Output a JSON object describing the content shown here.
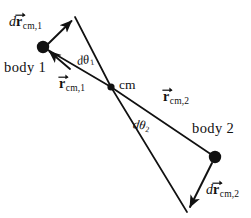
{
  "figure": {
    "kind": "physics-vector-diagram",
    "width": 251,
    "height": 218,
    "background_color": "#ffffff",
    "stroke_color": "#111111",
    "marker_color": "#111111"
  },
  "labels": {
    "dr1": {
      "d": "d",
      "vector": "r",
      "subscript": "cm,1",
      "full_text": "dr_cm,1"
    },
    "body1": "body 1",
    "dtheta1": {
      "d": "d",
      "symbol": "θ",
      "subscript": "1",
      "full_text": "dθ_1"
    },
    "rcm1": {
      "vector": "r",
      "subscript": "cm,1",
      "full_text": "r_cm,1"
    },
    "cm": "cm",
    "rcm2": {
      "vector": "r",
      "subscript": "cm,2",
      "full_text": "r_cm,2"
    },
    "dtheta2": {
      "d": "d",
      "symbol": "θ",
      "subscript": "2",
      "full_text": "dθ_2"
    },
    "body2": "body 2",
    "dr2": {
      "d": "d",
      "vector": "r",
      "subscript": "cm,2",
      "full_text": "dr_cm,2"
    }
  },
  "geometry": {
    "points": {
      "cm": {
        "x": 111,
        "y": 87,
        "name": "center-of-mass",
        "marker": "filled-dot",
        "radius": 3.6
      },
      "body1": {
        "x": 43,
        "y": 47,
        "name": "body-1-position",
        "marker": "filled-dot",
        "radius": 6.2
      },
      "body1_rotated": {
        "x": 75,
        "y": 17,
        "name": "body-1-rotated-position",
        "marker": "none"
      },
      "body2": {
        "x": 215,
        "y": 157,
        "name": "body-2-position",
        "marker": "filled-dot",
        "radius": 6.2
      },
      "body2_rotated": {
        "x": 187,
        "y": 212,
        "name": "body-2-rotated-position",
        "marker": "none"
      }
    },
    "segments": [
      {
        "name": "r-cm-1-line",
        "from": "cm",
        "to": "body1",
        "arrow": false
      },
      {
        "name": "r-cm-1-rotated-line",
        "from": "cm",
        "to": "body1_rotated",
        "arrow": false
      },
      {
        "name": "r-cm-2-line",
        "from": "cm",
        "to": "body2",
        "arrow": false
      },
      {
        "name": "r-cm-2-rotated-line",
        "from": "cm",
        "to": "body2_rotated",
        "arrow": false
      }
    ],
    "displacement_arrows": [
      {
        "name": "dr-cm-1-arrow",
        "from": "body1",
        "to": "body1_rotated",
        "label": "dr1"
      },
      {
        "name": "dr-cm-1-return-arrow",
        "from": "body1_rotated",
        "to": "body1",
        "label": "dr1"
      },
      {
        "name": "dr-cm-2-arrow",
        "from": "body2",
        "to": "body2_rotated",
        "label": "dr2"
      }
    ]
  }
}
